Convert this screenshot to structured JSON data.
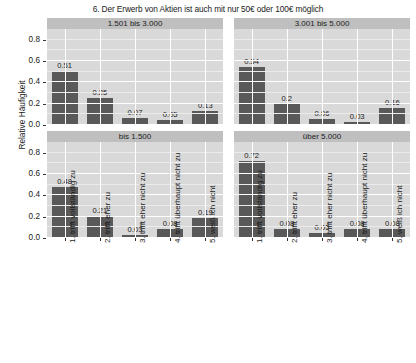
{
  "chart_data": {
    "type": "bar",
    "title": "6. Der Erwerb von Aktien ist auch mit nur 50€ oder 100€ möglich",
    "xlabel": "",
    "ylabel": "Relative Häufigkeit",
    "ylim": [
      0,
      0.9
    ],
    "yticks": [
      "0.0",
      "0.2",
      "0.4",
      "0.6",
      "0.8"
    ],
    "ytick_values": [
      0.0,
      0.2,
      0.4,
      0.6,
      0.8
    ],
    "grid": true,
    "legend": "none",
    "facet_layout": "2x2",
    "categories": [
      "1. trifft vollständig zu",
      "2. trifft eher zu",
      "3. trifft eher nicht zu",
      "4. trifft überhaupt nicht zu",
      "5. weiß ich nicht"
    ],
    "panels": [
      {
        "id": "panel-1501-3000",
        "position": "top-left",
        "label": "1.501 bis 3.000",
        "values": [
          0.51,
          0.25,
          0.07,
          0.05,
          0.13
        ],
        "value_labels": [
          "0.51",
          "0.25",
          "0.07",
          "0.05",
          "0.13"
        ]
      },
      {
        "id": "panel-3001-5000",
        "position": "top-right",
        "label": "3.001 bis 5.000",
        "values": [
          0.54,
          0.2,
          0.06,
          0.03,
          0.16
        ],
        "value_labels": [
          "0.54",
          "0.2",
          "0.06",
          "0.03",
          "0.16"
        ]
      },
      {
        "id": "panel-bis-1500",
        "position": "bottom-left",
        "label": "bis 1.500",
        "values": [
          0.48,
          0.21,
          0.03,
          0.08,
          0.19
        ],
        "value_labels": [
          "0.48",
          "0.21",
          "0.03",
          "0.08",
          "0.19"
        ]
      },
      {
        "id": "panel-ueber-5000",
        "position": "bottom-right",
        "label": "über 5.000",
        "values": [
          0.72,
          0.08,
          0.05,
          0.08,
          0.08
        ],
        "value_labels": [
          "0.72",
          "0.08",
          "0.05",
          "0.08",
          "0.08"
        ]
      }
    ],
    "colors": {
      "bar": "#595959",
      "panel_background": "#d9d9d9",
      "strip_background": "#bfbfbf",
      "gridline_major": "#ffffff",
      "gridline_minor": "#ebebeb",
      "figure_background": "#ffffff",
      "text": "#1a1a1a"
    }
  }
}
